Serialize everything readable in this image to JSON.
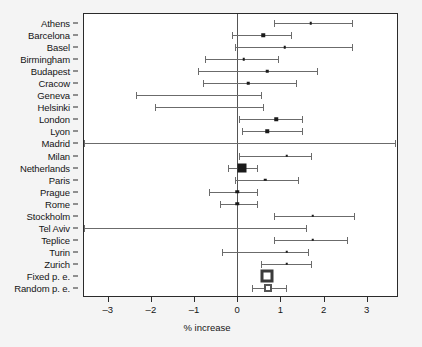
{
  "chart_data": {
    "type": "scatter",
    "plot_kind": "forest-plot",
    "title": "",
    "xlabel": "% increase",
    "ylabel": "",
    "xlim": [
      -3.55,
      3.7
    ],
    "xticks": [
      -3,
      -2,
      -1,
      0,
      1,
      2,
      3
    ],
    "xticklabels": [
      "-3",
      "-2",
      "-1",
      "0",
      "1",
      "2",
      "3"
    ],
    "grid": false,
    "reference_line": 0,
    "categories": [
      "Athens",
      "Barcelona",
      "Basel",
      "Birmingham",
      "Budapest",
      "Cracow",
      "Geneva",
      "Helsinki",
      "London",
      "Lyon",
      "Madrid",
      "Milan",
      "Netherlands",
      "Paris",
      "Prague",
      "Rome",
      "Stockholm",
      "Tel Aviv",
      "Teplice",
      "Turin",
      "Zurich",
      "Fixed p. e.",
      "Random p. e."
    ],
    "columns": [
      "study",
      "estimate",
      "ci_low",
      "ci_high",
      "marker",
      "weight"
    ],
    "rows": [
      {
        "study": "Athens",
        "estimate": 1.7,
        "ci_low": 0.85,
        "ci_high": 2.65,
        "marker": "square",
        "weight": 1
      },
      {
        "study": "Barcelona",
        "estimate": 0.6,
        "ci_low": -0.12,
        "ci_high": 1.25,
        "marker": "square",
        "weight": 2
      },
      {
        "study": "Basel",
        "estimate": 1.1,
        "ci_low": -0.05,
        "ci_high": 2.65,
        "marker": "square",
        "weight": 1
      },
      {
        "study": "Birmingham",
        "estimate": 0.15,
        "ci_low": -0.75,
        "ci_high": 0.95,
        "marker": "square",
        "weight": 1
      },
      {
        "study": "Budapest",
        "estimate": 0.7,
        "ci_low": -0.9,
        "ci_high": 1.85,
        "marker": "square",
        "weight": 1
      },
      {
        "study": "Cracow",
        "estimate": 0.25,
        "ci_low": -0.8,
        "ci_high": 1.35,
        "marker": "square",
        "weight": 1
      },
      {
        "study": "Geneva",
        "estimate": 0.4,
        "ci_low": -2.35,
        "ci_high": 0.55,
        "marker": "none",
        "weight": 1
      },
      {
        "study": "Helsinki",
        "estimate": 0.2,
        "ci_low": -1.9,
        "ci_high": 0.6,
        "marker": "none",
        "weight": 1
      },
      {
        "study": "London",
        "estimate": 0.9,
        "ci_low": 0.05,
        "ci_high": 1.5,
        "marker": "square",
        "weight": 2
      },
      {
        "study": "Lyon",
        "estimate": 0.7,
        "ci_low": 0.1,
        "ci_high": 1.5,
        "marker": "square",
        "weight": 2
      },
      {
        "study": "Madrid",
        "estimate": 1.7,
        "ci_low": -3.55,
        "ci_high": 3.65,
        "marker": "none",
        "weight": 1
      },
      {
        "study": "Milan",
        "estimate": 1.15,
        "ci_low": 0.05,
        "ci_high": 1.7,
        "marker": "square",
        "weight": 1
      },
      {
        "study": "Netherlands",
        "estimate": 0.12,
        "ci_low": -0.22,
        "ci_high": 0.45,
        "marker": "square-big",
        "weight": 5
      },
      {
        "study": "Paris",
        "estimate": 0.65,
        "ci_low": -0.05,
        "ci_high": 1.4,
        "marker": "square",
        "weight": 1
      },
      {
        "study": "Prague",
        "estimate": 0.0,
        "ci_low": -0.65,
        "ci_high": 0.45,
        "marker": "square",
        "weight": 2
      },
      {
        "study": "Rome",
        "estimate": 0.0,
        "ci_low": -0.4,
        "ci_high": 0.45,
        "marker": "square",
        "weight": 2
      },
      {
        "study": "Stockholm",
        "estimate": 1.75,
        "ci_low": 0.85,
        "ci_high": 2.7,
        "marker": "square",
        "weight": 1
      },
      {
        "study": "Tel Aviv",
        "estimate": 0.75,
        "ci_low": -3.55,
        "ci_high": 1.6,
        "marker": "none",
        "weight": 1
      },
      {
        "study": "Teplice",
        "estimate": 1.75,
        "ci_low": 0.85,
        "ci_high": 2.55,
        "marker": "square",
        "weight": 1
      },
      {
        "study": "Turin",
        "estimate": 1.15,
        "ci_low": -0.35,
        "ci_high": 1.65,
        "marker": "square",
        "weight": 1
      },
      {
        "study": "Zurich",
        "estimate": 1.15,
        "ci_low": 0.55,
        "ci_high": 1.7,
        "marker": "square",
        "weight": 1
      },
      {
        "study": "Fixed p. e.",
        "estimate": 0.68,
        "ci_low": 0.68,
        "ci_high": 0.68,
        "marker": "summary-fixed",
        "weight": 9
      },
      {
        "study": "Random p. e.",
        "estimate": 0.72,
        "ci_low": 0.33,
        "ci_high": 1.12,
        "marker": "summary-random",
        "weight": 6
      }
    ]
  },
  "colors": {
    "background": "#f4f4f4",
    "plot_background": "#ffffff",
    "frame": "#2b2b2b",
    "ci_line": "#6b6b6b",
    "point": "#1a1a1a",
    "reference_line": "#555555",
    "text": "#141414"
  }
}
